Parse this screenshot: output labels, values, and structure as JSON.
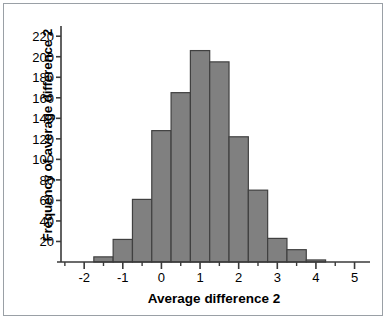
{
  "chart_data": {
    "type": "bar",
    "title": "",
    "xlabel": "Average difference 2",
    "ylabel": "Frequency of average difference 2",
    "xlim": [
      -2.6,
      5.4
    ],
    "ylim": [
      0,
      228
    ],
    "grid": false,
    "legend": null,
    "bin_width": 0.5,
    "bin_edges": [
      -1.75,
      -1.25,
      -0.75,
      -0.25,
      0.25,
      0.75,
      1.25,
      1.75,
      2.25,
      2.75,
      3.25,
      3.75,
      4.25
    ],
    "bin_centers": [
      -1.5,
      -1.0,
      -0.5,
      0.0,
      0.5,
      1.0,
      1.5,
      2.0,
      2.5,
      3.0,
      3.5,
      4.0
    ],
    "categories": [
      "-1.75 to -1.25",
      "-1.25 to -0.75",
      "-0.75 to -0.25",
      "-0.25 to 0.25",
      "0.25 to 0.75",
      "0.75 to 1.25",
      "1.25 to 1.75",
      "1.75 to 2.25",
      "2.25 to 2.75",
      "2.75 to 3.25",
      "3.25 to 3.75",
      "3.75 to 4.25"
    ],
    "values": [
      5,
      22,
      61,
      128,
      165,
      206,
      195,
      122,
      70,
      23,
      12,
      2
    ],
    "bar_color": "#808080",
    "bar_edge_color": "#404040",
    "axis_color": "#3a3a3a"
  },
  "axes": {
    "y_ticks": [
      20,
      40,
      60,
      80,
      100,
      120,
      140,
      160,
      180,
      200,
      220
    ],
    "y_tick_labels": [
      "20",
      "40",
      "60",
      "80",
      "100",
      "120",
      "140",
      "160",
      "180",
      "200",
      "220"
    ],
    "x_ticks": [
      -2,
      -1,
      0,
      1,
      2,
      3,
      4,
      5
    ],
    "x_tick_labels": [
      "-2",
      "-1",
      "0",
      "1",
      "2",
      "3",
      "4",
      "5"
    ],
    "x_minor_ticks": [
      -2.5,
      -1.5,
      -0.5,
      0.5,
      1.5,
      2.5,
      3.5,
      4.5
    ]
  }
}
